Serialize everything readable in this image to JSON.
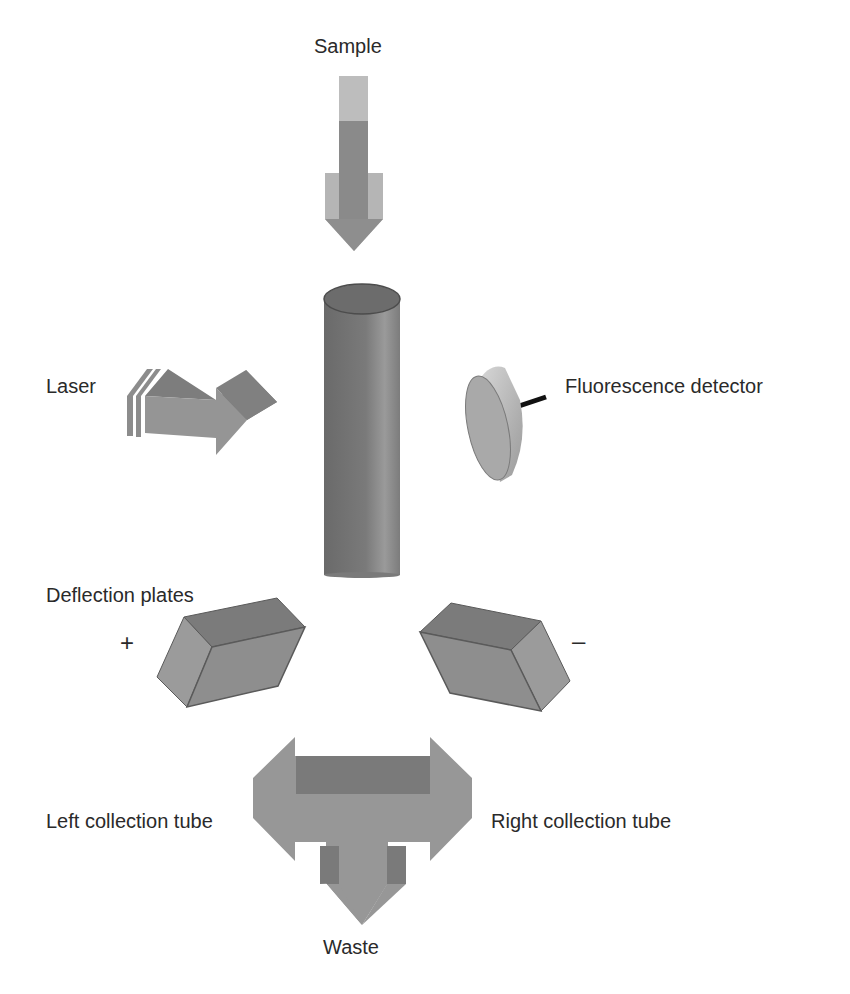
{
  "diagram": {
    "labels": {
      "sample": "Sample",
      "laser": "Laser",
      "fluorescence_detector": "Fluorescence detector",
      "deflection_plates": "Deflection plates",
      "plus": "+",
      "minus": "–",
      "left_collection_tube": "Left collection tube",
      "right_collection_tube": "Right collection tube",
      "waste": "Waste"
    },
    "components": [
      {
        "id": "sample-arrow",
        "kind": "arrow-down"
      },
      {
        "id": "flow-cell",
        "kind": "cylinder"
      },
      {
        "id": "laser-arrow",
        "kind": "arrow-right-3d"
      },
      {
        "id": "fluorescence-detector",
        "kind": "disk"
      },
      {
        "id": "left-deflection-plate",
        "kind": "prism",
        "polarity": "+"
      },
      {
        "id": "right-deflection-plate",
        "kind": "prism",
        "polarity": "–"
      },
      {
        "id": "sorting-arrow",
        "kind": "three-way-arrow",
        "outputs": [
          "Left collection tube",
          "Right collection tube",
          "Waste"
        ]
      }
    ],
    "colors": {
      "light_gray": "#b9b9b9",
      "mid_gray": "#8c8c8c",
      "dark_gray": "#6e6e6e",
      "edge": "#555555",
      "text": "#2a2a2a"
    }
  }
}
